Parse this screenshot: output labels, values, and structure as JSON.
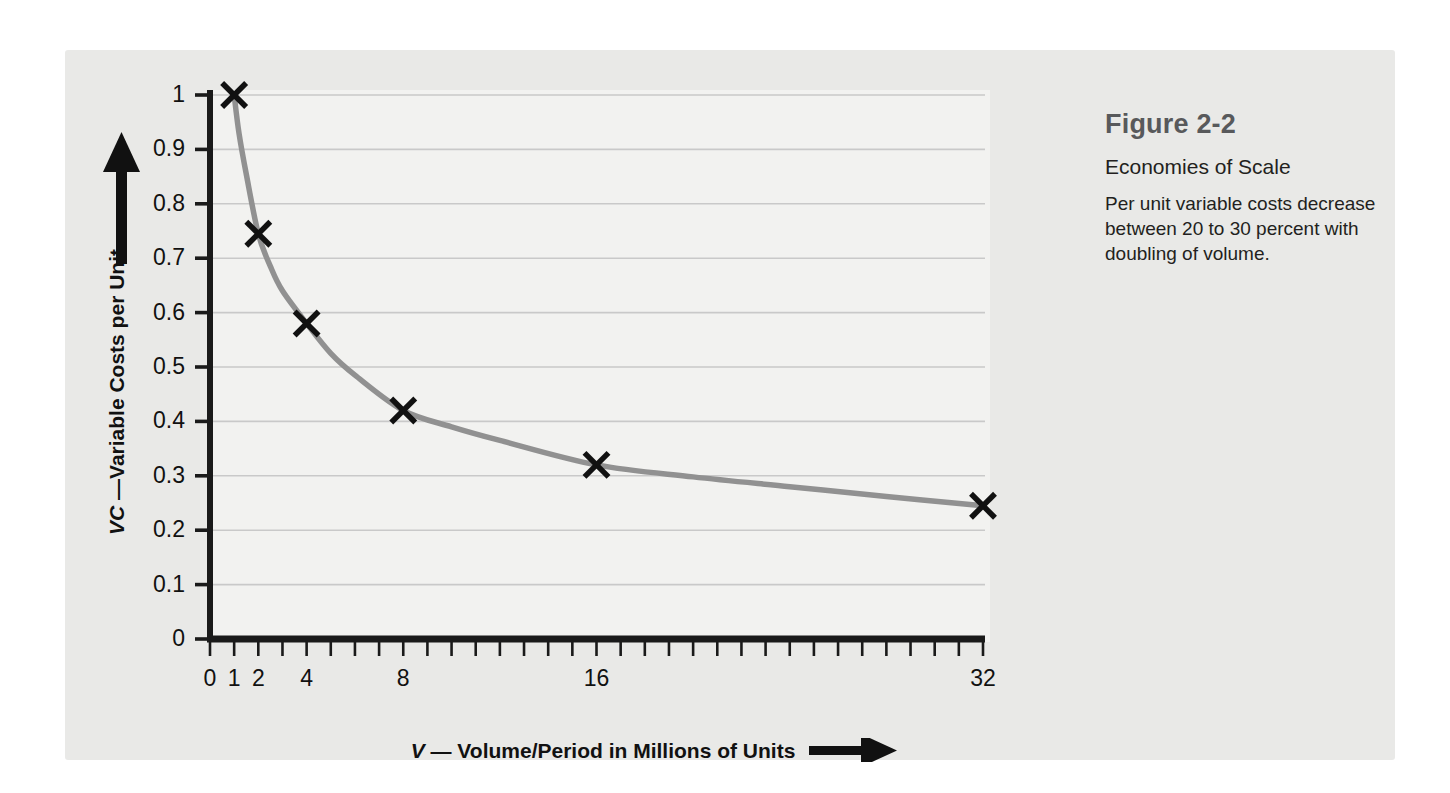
{
  "figure": {
    "caption_title": "Figure 2-2",
    "caption_subtitle": "Economies of Scale",
    "caption_body": "Per unit variable costs decrease between 20 to 30 percent with doubling of volume."
  },
  "colors": {
    "panel_background": "#e9e9e7",
    "plot_background": "#f2f2f0",
    "axis": "#1a1a1a",
    "gridline": "#c9c9c9",
    "curve": "#919191",
    "marker": "#111111",
    "caption_title": "#58595b",
    "caption_text": "#231f20"
  },
  "axis_titles": {
    "y_prefix": "VC",
    "y_rest": " —Variable Costs per Unit",
    "x_prefix": "V",
    "x_rest": " — Volume/Period in Millions of Units",
    "y_arrow_icon": "up-arrow-icon",
    "x_arrow_icon": "right-arrow-icon"
  },
  "chart_data": {
    "type": "line",
    "title": "Economies of Scale",
    "xlabel": "V — Volume/Period in Millions of Units",
    "ylabel": "VC —Variable Costs per Unit",
    "xlim": [
      0,
      32
    ],
    "ylim": [
      0,
      1
    ],
    "grid": "horizontal",
    "legend": "none",
    "x_tick_labels": [
      "0",
      "1",
      "2",
      "4",
      "8",
      "16",
      "32"
    ],
    "x_tick_values": [
      0,
      1,
      2,
      4,
      8,
      16,
      32
    ],
    "x_minor_tick_interval": 1,
    "y_tick_labels": [
      "0",
      "0.1",
      "0.2",
      "0.3",
      "0.4",
      "0.5",
      "0.6",
      "0.7",
      "0.8",
      "0.9",
      "1"
    ],
    "y_tick_values": [
      0,
      0.1,
      0.2,
      0.3,
      0.4,
      0.5,
      0.6,
      0.7,
      0.8,
      0.9,
      1
    ],
    "series": [
      {
        "name": "Per unit variable cost",
        "marker": "x",
        "x": [
          1,
          2,
          4,
          8,
          16,
          32
        ],
        "values": [
          1.0,
          0.745,
          0.58,
          0.42,
          0.32,
          0.245
        ]
      }
    ],
    "curve_points": [
      [
        1,
        1.0
      ],
      [
        1.2,
        0.93
      ],
      [
        1.5,
        0.855
      ],
      [
        2,
        0.745
      ],
      [
        2.5,
        0.685
      ],
      [
        3,
        0.64
      ],
      [
        4,
        0.58
      ],
      [
        5,
        0.525
      ],
      [
        6,
        0.485
      ],
      [
        8,
        0.42
      ],
      [
        10,
        0.39
      ],
      [
        12,
        0.365
      ],
      [
        16,
        0.32
      ],
      [
        20,
        0.298
      ],
      [
        24,
        0.28
      ],
      [
        28,
        0.262
      ],
      [
        32,
        0.245
      ]
    ]
  }
}
